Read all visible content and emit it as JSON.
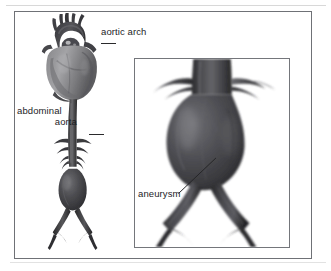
{
  "figure": {
    "type": "medical-illustration",
    "rendering": "grayscale anatomical drawing",
    "panels": [
      {
        "name": "overview-panel",
        "description": "Heart with aortic arch, descending and abdominal aorta, aneurysm, iliac bifurcation"
      },
      {
        "name": "magnified-inset-panel",
        "description": "Close-up of abdominal aorta showing fusiform aneurysm and iliac bifurcation"
      }
    ]
  },
  "labels": {
    "aortic_arch": "aortic arch",
    "abdominal_aorta_line1": "abdominal",
    "abdominal_aorta_line2": "aorta",
    "aneurysm": "aneurysm"
  },
  "colors": {
    "frame_border": "#6f7176",
    "inset_border": "#74767b",
    "vessel_dark": "#3a3a3c",
    "vessel_mid": "#545457",
    "vessel_light": "#7d7d80",
    "heart_light": "#9b9b9d",
    "heart_mid": "#76767a",
    "background": "#ffffff",
    "text": "#1d1d1f",
    "leader_line": "#2a2a2c"
  }
}
